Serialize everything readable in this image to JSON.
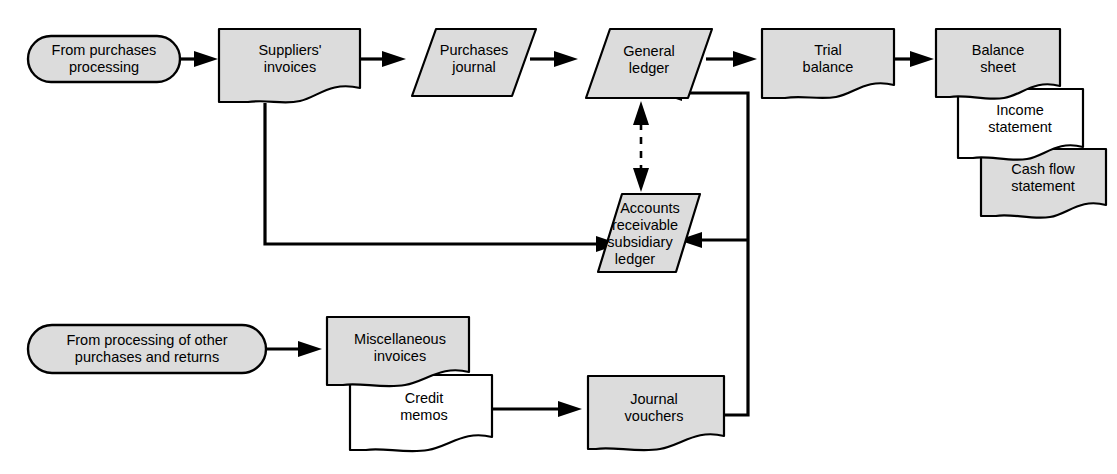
{
  "diagram": {
    "colors": {
      "shape_fill": "#dcdcdc",
      "shape_fill_alt": "#ffffff",
      "stroke": "#000000",
      "background": "#ffffff"
    },
    "nodes": [
      {
        "id": "from-purchases-processing",
        "kind": "terminator",
        "lines": [
          "From purchases",
          "processing"
        ],
        "fill": "#dcdcdc"
      },
      {
        "id": "suppliers-invoices",
        "kind": "document",
        "lines": [
          "Suppliers'",
          "invoices"
        ],
        "fill": "#dcdcdc"
      },
      {
        "id": "purchases-journal",
        "kind": "parallelogram",
        "lines": [
          "Purchases",
          "journal"
        ],
        "fill": "#dcdcdc"
      },
      {
        "id": "general-ledger",
        "kind": "parallelogram",
        "lines": [
          "General",
          "ledger"
        ],
        "fill": "#dcdcdc"
      },
      {
        "id": "trial-balance",
        "kind": "document",
        "lines": [
          "Trial",
          "balance"
        ],
        "fill": "#dcdcdc"
      },
      {
        "id": "balance-sheet",
        "kind": "document",
        "lines": [
          "Balance",
          "sheet"
        ],
        "fill": "#dcdcdc"
      },
      {
        "id": "income-statement",
        "kind": "document",
        "lines": [
          "Income",
          "statement"
        ],
        "fill": "#ffffff"
      },
      {
        "id": "cash-flow-statement",
        "kind": "document",
        "lines": [
          "Cash flow",
          "statement"
        ],
        "fill": "#dcdcdc"
      },
      {
        "id": "accounts-receivable-subsidiary-ledger",
        "kind": "parallelogram",
        "lines": [
          "Accounts",
          "receivable",
          "subsidiary",
          "ledger"
        ],
        "fill": "#dcdcdc"
      },
      {
        "id": "from-processing-of-other-purchases-and-returns",
        "kind": "terminator",
        "lines": [
          "From processing of other",
          "purchases and returns"
        ],
        "fill": "#dcdcdc"
      },
      {
        "id": "miscellaneous-invoices",
        "kind": "document",
        "lines": [
          "Miscellaneous",
          "invoices"
        ],
        "fill": "#dcdcdc"
      },
      {
        "id": "credit-memos",
        "kind": "document",
        "lines": [
          "Credit",
          "memos"
        ],
        "fill": "#ffffff"
      },
      {
        "id": "journal-vouchers",
        "kind": "document",
        "lines": [
          "Journal",
          "vouchers"
        ],
        "fill": "#dcdcdc"
      }
    ],
    "edges": [
      {
        "id": "edge-from-purchases-to-suppliers-invoices",
        "from": "from-purchases-processing",
        "to": "suppliers-invoices",
        "style": "solid",
        "arrows": "end"
      },
      {
        "id": "edge-suppliers-invoices-to-purchases-journal",
        "from": "suppliers-invoices",
        "to": "purchases-journal",
        "style": "solid",
        "arrows": "end"
      },
      {
        "id": "edge-purchases-journal-to-general-ledger",
        "from": "purchases-journal",
        "to": "general-ledger",
        "style": "solid",
        "arrows": "end"
      },
      {
        "id": "edge-general-ledger-to-trial-balance",
        "from": "general-ledger",
        "to": "trial-balance",
        "style": "solid",
        "arrows": "end"
      },
      {
        "id": "edge-trial-balance-to-balance-sheet",
        "from": "trial-balance",
        "to": "balance-sheet",
        "style": "solid",
        "arrows": "end"
      },
      {
        "id": "edge-suppliers-invoices-to-ar-subsidiary-ledger",
        "from": "suppliers-invoices",
        "to": "accounts-receivable-subsidiary-ledger",
        "style": "solid",
        "arrows": "end"
      },
      {
        "id": "edge-general-ledger-ar-subsidiary-ledger-posting",
        "from": "general-ledger",
        "to": "accounts-receivable-subsidiary-ledger",
        "style": "dashed",
        "arrows": "both"
      },
      {
        "id": "edge-from-other-processing-to-miscellaneous-invoices",
        "from": "from-processing-of-other-purchases-and-returns",
        "to": "miscellaneous-invoices",
        "style": "solid",
        "arrows": "end"
      },
      {
        "id": "edge-credit-memos-to-journal-vouchers",
        "from": "credit-memos",
        "to": "journal-vouchers",
        "style": "solid",
        "arrows": "end"
      },
      {
        "id": "edge-journal-vouchers-to-ar-subsidiary-ledger",
        "from": "journal-vouchers",
        "to": "accounts-receivable-subsidiary-ledger",
        "style": "solid",
        "arrows": "end"
      },
      {
        "id": "edge-journal-vouchers-to-general-ledger",
        "from": "journal-vouchers",
        "to": "general-ledger",
        "style": "solid",
        "arrows": "end"
      }
    ]
  },
  "labels": {
    "from_purchases_processing_l1": "From purchases",
    "from_purchases_processing_l2": "processing",
    "suppliers_invoices_l1": "Suppliers'",
    "suppliers_invoices_l2": "invoices",
    "purchases_journal_l1": "Purchases",
    "purchases_journal_l2": "journal",
    "general_ledger_l1": "General",
    "general_ledger_l2": "ledger",
    "trial_balance_l1": "Trial",
    "trial_balance_l2": "balance",
    "balance_sheet_l1": "Balance",
    "balance_sheet_l2": "sheet",
    "income_statement_l1": "Income",
    "income_statement_l2": "statement",
    "cash_flow_statement_l1": "Cash flow",
    "cash_flow_statement_l2": "statement",
    "ar_ledger_l1": "Accounts",
    "ar_ledger_l2": "receivable",
    "ar_ledger_l3": "subsidiary",
    "ar_ledger_l4": "ledger",
    "from_other_processing_l1": "From processing of other",
    "from_other_processing_l2": "purchases and returns",
    "miscellaneous_invoices_l1": "Miscellaneous",
    "miscellaneous_invoices_l2": "invoices",
    "credit_memos_l1": "Credit",
    "credit_memos_l2": "memos",
    "journal_vouchers_l1": "Journal",
    "journal_vouchers_l2": "vouchers"
  }
}
